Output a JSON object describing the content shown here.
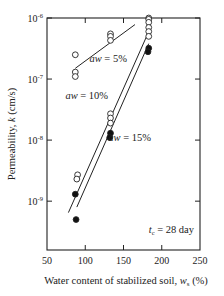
{
  "chart_data": {
    "type": "scatter",
    "title": "",
    "xlabel": "Water content of stabilized soil, w_s (%)",
    "xlabel_parts": {
      "main": "Water content of stabilized soil, ",
      "var": "w",
      "sub": "s",
      "tail": " (%)"
    },
    "ylabel": "Permeability, k (cm/s)",
    "ylabel_parts": {
      "main": "Permeability, ",
      "var": "k",
      "tail": " (cm/s)"
    },
    "xlim": [
      50,
      250
    ],
    "ylim_log10": [
      -9.8,
      -6
    ],
    "yscale": "log",
    "grid": false,
    "x_ticks": [
      50,
      100,
      150,
      200,
      250
    ],
    "y_ticks": [
      {
        "value": -6,
        "label": "10",
        "exp": "-6"
      },
      {
        "value": -7,
        "label": "10",
        "exp": "-7"
      },
      {
        "value": -8,
        "label": "10",
        "exp": "-8"
      },
      {
        "value": -9,
        "label": "10",
        "exp": "-9"
      }
    ],
    "annotation": {
      "text_var": "t",
      "text_sub": "c",
      "text_tail": " = 28 day",
      "x": 215,
      "y_log10": -9.45
    },
    "series": [
      {
        "name": "aw = 5%",
        "label_var": "aw",
        "label_tail": " = 5%",
        "marker": "open-circle",
        "points": [
          {
            "x": 87,
            "k": 2.5e-07
          },
          {
            "x": 87,
            "k": 1.3e-07
          },
          {
            "x": 87,
            "k": 1.1e-07
          },
          {
            "x": 133,
            "k": 5.5e-07
          },
          {
            "x": 133,
            "k": 5e-07
          },
          {
            "x": 133,
            "k": 4.3e-07
          },
          {
            "x": 183,
            "k": 1e-06
          },
          {
            "x": 183,
            "k": 9.5e-07
          },
          {
            "x": 183,
            "k": 8.5e-07
          }
        ],
        "fit_line": [
          {
            "x": 87,
            "k": 1.5e-07
          },
          {
            "x": 165,
            "k": 7.8e-07
          }
        ],
        "label_pos": {
          "x": 130,
          "k": 1.9e-07
        }
      },
      {
        "name": "aw = 10%",
        "label_var": "aw",
        "label_tail": " = 10%",
        "marker": "open-circle",
        "points": [
          {
            "x": 90,
            "k": 2.7e-09
          },
          {
            "x": 89,
            "k": 2.3e-09
          },
          {
            "x": 133,
            "k": 2.7e-08
          },
          {
            "x": 133,
            "k": 2.3e-08
          },
          {
            "x": 133,
            "k": 1.9e-08
          },
          {
            "x": 183,
            "k": 7e-07
          },
          {
            "x": 183,
            "k": 6e-07
          },
          {
            "x": 183,
            "k": 5e-07
          }
        ],
        "fit_line": [
          {
            "x": 78,
            "k": 6.5e-10
          },
          {
            "x": 183,
            "k": 6e-07
          }
        ],
        "label_pos": {
          "x": 102,
          "k": 4.7e-08
        }
      },
      {
        "name": "aw = 15%",
        "label_var": "aw",
        "label_tail": " = 15%",
        "marker": "filled-circle",
        "points": [
          {
            "x": 87,
            "k": 1.3e-09
          },
          {
            "x": 88,
            "k": 5e-10
          },
          {
            "x": 133,
            "k": 1.3e-08
          },
          {
            "x": 132,
            "k": 1.1e-08
          },
          {
            "x": 183,
            "k": 3.2e-07
          },
          {
            "x": 182,
            "k": 2.8e-07
          }
        ],
        "fit_line": [
          {
            "x": 89,
            "k": 8e-10
          },
          {
            "x": 183,
            "k": 3.8e-07
          }
        ],
        "label_pos": {
          "x": 158,
          "k": 9.5e-09
        }
      }
    ]
  }
}
